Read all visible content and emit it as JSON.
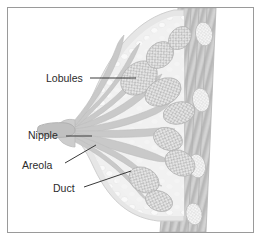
{
  "figure": {
    "view": "sagittal cross-section",
    "orientation": "nipple at left, chest wall at right",
    "frame": {
      "border_color": "#9a9a9a",
      "background_color": "#ffffff"
    }
  },
  "palette": {
    "background": "#ffffff",
    "skin_outline": "#d8d8d8",
    "fat_tissue": "#ececec",
    "fat_tissue_light": "#f4f4f4",
    "lobule_fill": "#bdbdbd",
    "lobule_stipple": "#e8e8e8",
    "duct_fill": "#c6c6c6",
    "nipple_fill": "#bfbfbf",
    "areola_fill": "#cccccc",
    "muscle_fill": "#c2c2c2",
    "muscle_stripe": "#b0b0b0",
    "rib_fill": "#e2e2e2",
    "rib_outline": "#bbbbbb",
    "label_text": "#2b2b2b",
    "leader_line": "#3a3a3a"
  },
  "labels": [
    {
      "id": "lobules",
      "text": "Lobules",
      "text_x": 38,
      "text_y": 74,
      "anchor": "start",
      "leader": {
        "x1": 82,
        "y1": 70,
        "x2": 128,
        "y2": 70
      },
      "points_to": "glandular lobule cluster in upper breast"
    },
    {
      "id": "nipple",
      "text": "Nipple",
      "text_x": 20,
      "text_y": 131,
      "anchor": "start",
      "leader": {
        "x1": 58,
        "y1": 128,
        "x2": 84,
        "y2": 128
      },
      "points_to": "nipple tip at left of breast"
    },
    {
      "id": "areola",
      "text": "Areola",
      "text_x": 14,
      "text_y": 161,
      "anchor": "start",
      "leader": {
        "x1": 57,
        "y1": 155,
        "x2": 88,
        "y2": 137
      },
      "points_to": "pigmented areola skin surrounding nipple"
    },
    {
      "id": "duct",
      "text": "Duct",
      "text_x": 45,
      "text_y": 184,
      "anchor": "start",
      "leader": {
        "x1": 76,
        "y1": 179,
        "x2": 123,
        "y2": 163
      },
      "points_to": "lactiferous duct running toward nipple"
    }
  ],
  "anatomy": {
    "structures": [
      {
        "name": "Lobules",
        "count_drawn": 9,
        "appearance": "stippled grape-like gray clusters"
      },
      {
        "name": "Ducts",
        "count_drawn": 9,
        "appearance": "tapering tubes converging on the nipple"
      },
      {
        "name": "Nipple",
        "count_drawn": 1,
        "appearance": "protruding cone at left"
      },
      {
        "name": "Areola",
        "count_drawn": 1,
        "appearance": "darker skin band around nipple base"
      },
      {
        "name": "Fatty tissue",
        "count_drawn": 1,
        "appearance": "pale mottled background filling the breast"
      },
      {
        "name": "Pectoral muscle",
        "count_drawn": 1,
        "appearance": "diagonal striated band at right"
      },
      {
        "name": "Ribs",
        "count_drawn": 4,
        "appearance": "pale stippled ovals within muscle band"
      }
    ]
  }
}
